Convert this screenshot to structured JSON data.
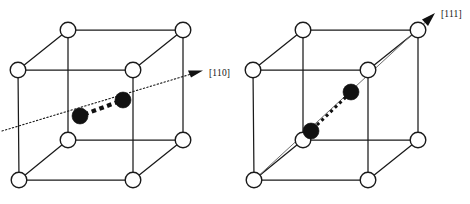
{
  "figure": {
    "background_color": "#ffffff",
    "line_color": "#1a1a1a",
    "atom_color": "#111111",
    "node_fill": "#ffffff",
    "width": 470,
    "height": 204
  },
  "panels": [
    {
      "id": "left-panel",
      "name": "cube-110",
      "direction_label": "[110]",
      "direction_name": "one-one-zero-direction",
      "arrow_style": "dotted-line-with-solid-head",
      "atom_count": 2,
      "bond_style": "thick-dashed",
      "lattice_node_count": 8,
      "cube": {
        "front_top_left": [
          18,
          70
        ],
        "front_top_right": [
          133,
          70
        ],
        "front_bottom_left": [
          19,
          180
        ],
        "front_bottom_right": [
          133,
          180
        ],
        "back_top_left": [
          68,
          30
        ],
        "back_top_right": [
          183,
          30
        ],
        "back_bottom_left": [
          68,
          140
        ],
        "back_bottom_right": [
          183,
          140
        ]
      },
      "atoms": [
        {
          "cx": 80,
          "cy": 116,
          "r": 8.0,
          "name": "atom-lower-left"
        },
        {
          "cx": 123,
          "cy": 100,
          "r": 8.0,
          "name": "atom-upper-right"
        }
      ],
      "direction_line": {
        "x1": 2,
        "y1": 131,
        "x2": 196,
        "y2": 73
      },
      "arrow_tip": [
        202,
        71
      ],
      "label_pos": [
        209,
        76
      ]
    },
    {
      "id": "right-panel",
      "name": "cube-111",
      "direction_label": "[111]",
      "direction_name": "one-one-one-direction",
      "arrow_style": "solid-line-with-solid-head",
      "atom_count": 2,
      "bond_style": "fine-dashed",
      "lattice_node_count": 8,
      "cube": {
        "front_top_left": [
          253,
          70
        ],
        "front_top_right": [
          368,
          70
        ],
        "front_bottom_left": [
          254,
          180
        ],
        "front_bottom_right": [
          368,
          180
        ],
        "back_top_left": [
          303,
          30
        ],
        "back_top_right": [
          418,
          30
        ],
        "back_bottom_left": [
          303,
          140
        ],
        "back_bottom_right": [
          418,
          140
        ]
      },
      "atoms": [
        {
          "cx": 311,
          "cy": 131,
          "r": 8.0,
          "name": "atom-lower-left"
        },
        {
          "cx": 351,
          "cy": 92,
          "r": 8.0,
          "name": "atom-upper-right"
        }
      ],
      "direction_line": {
        "x1": 254,
        "y1": 180,
        "x2": 432,
        "y2": 16
      },
      "arrow_tip": [
        434,
        14
      ],
      "label_pos": [
        441,
        17
      ]
    }
  ]
}
